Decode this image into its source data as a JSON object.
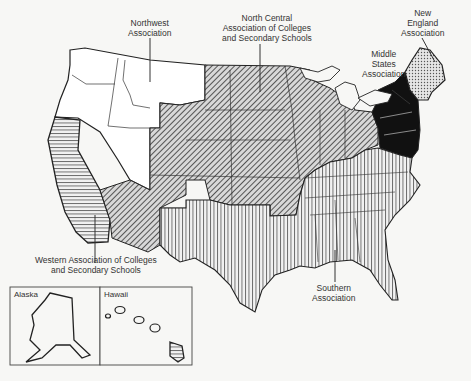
{
  "map": {
    "title": "Regional Accrediting Associations of the United States",
    "regions": [
      {
        "id": "northwest",
        "label_lines": [
          "Northwest",
          "Association"
        ],
        "pattern": "blank",
        "color": "#ffffff"
      },
      {
        "id": "north-central",
        "label_lines": [
          "North Central",
          "Association of Colleges",
          "and Secondary Schools"
        ],
        "pattern": "diagonal-hatch",
        "color": "#555555"
      },
      {
        "id": "new-england",
        "label_lines": [
          "New",
          "England",
          "Association"
        ],
        "pattern": "dotted",
        "color": "#bbbbbb"
      },
      {
        "id": "middle-states",
        "label_lines": [
          "Middle",
          "States",
          "Association"
        ],
        "pattern": "solid",
        "color": "#111111"
      },
      {
        "id": "western",
        "label_lines": [
          "Western Association of Colleges",
          "and Secondary Schools"
        ],
        "pattern": "horizontal-lines",
        "color": "#666666"
      },
      {
        "id": "southern",
        "label_lines": [
          "Southern",
          "Association"
        ],
        "pattern": "vertical-lines",
        "color": "#444444"
      }
    ],
    "insets": [
      {
        "id": "alaska",
        "label": "Alaska"
      },
      {
        "id": "hawaii",
        "label": "Hawaii"
      }
    ]
  }
}
